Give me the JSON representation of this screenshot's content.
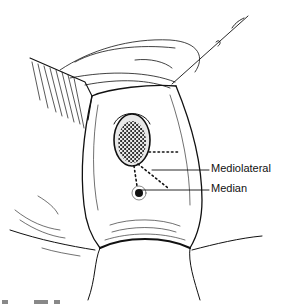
{
  "figure": {
    "labels": [
      {
        "id": "mediolateral",
        "text": "Mediolateral"
      },
      {
        "id": "median",
        "text": "Median"
      }
    ],
    "colors": {
      "ink": "#111111",
      "background": "#ffffff",
      "stipple": "#333333"
    }
  }
}
